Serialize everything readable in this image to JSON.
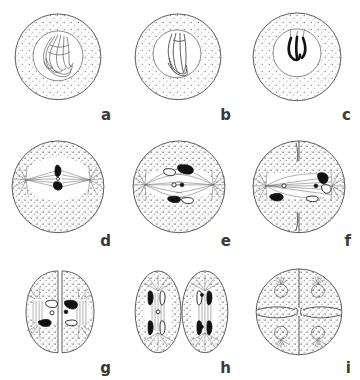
{
  "figure": {
    "style": "pen-and-ink line drawing with stippled cytoplasm",
    "background_color": "#ffffff",
    "ink_color": "#4a4a4a",
    "chromosome_color": "#111111",
    "rows": 3,
    "columns": 3,
    "panels": [
      {
        "label": "a",
        "stage_name": "Early prophase",
        "cell_shape": "circle",
        "nucleus": "present",
        "chromatin": "long thin tangled threads",
        "spindle": "none",
        "asters": 0,
        "chromosome_count": 0,
        "cell_count": 1
      },
      {
        "label": "b",
        "stage_name": "Mid prophase",
        "cell_shape": "circle",
        "nucleus": "present",
        "chromatin": "condensing into compact loop mass",
        "spindle": "none",
        "asters": 0,
        "chromosome_count": 0,
        "cell_count": 1
      },
      {
        "label": "c",
        "stage_name": "Late prophase",
        "cell_shape": "circle",
        "nucleus": "present, clear",
        "chromatin": "thick dark hooked chromosome mass",
        "spindle": "none",
        "asters": 0,
        "chromosome_count": 0,
        "cell_count": 1
      },
      {
        "label": "d",
        "stage_name": "Prometaphase",
        "cell_shape": "circle",
        "nucleus": "dissolved",
        "chromatin": "two dark chromosomes on equator",
        "spindle": "forming",
        "asters": 2,
        "chromosome_count": 2,
        "cell_count": 1
      },
      {
        "label": "e",
        "stage_name": "Metaphase",
        "cell_shape": "circle",
        "nucleus": "dissolved",
        "chromatin": "four chromosomes at metaphase plate",
        "spindle": "complete",
        "asters": 2,
        "chromosome_count": 4,
        "cell_count": 1
      },
      {
        "label": "f",
        "stage_name": "Anaphase with cleavage furrow",
        "cell_shape": "circle with furrow",
        "nucleus": "dissolved",
        "chromatin": "chromosomes separating toward poles",
        "spindle": "elongated, horizontal fibers",
        "asters": 2,
        "chromosome_count": 4,
        "cell_count": 1
      },
      {
        "label": "g",
        "stage_name": "Telophase / two daughter cells",
        "cell_shape": "two adjoining ovals",
        "nucleus": "reforming",
        "chromatin": "chromosomes in each daughter cell",
        "spindle": "remnant",
        "asters": 2,
        "chromosome_count": 6,
        "cell_count": 2
      },
      {
        "label": "h",
        "stage_name": "Second division in two cells",
        "cell_shape": "two separate ovals",
        "nucleus": "dissolved",
        "chromatin": "chromosomes at poles of each spindle",
        "spindle": "vertical in each cell",
        "asters": 4,
        "chromosome_count": 8,
        "cell_count": 2
      },
      {
        "label": "i",
        "stage_name": "Four-cell stage",
        "cell_shape": "four quadrant cells in a circle",
        "nucleus": "one per cell",
        "chromatin": "enclosed in nuclei",
        "spindle": "none",
        "asters": 4,
        "chromosome_count": 0,
        "cell_count": 4
      }
    ]
  }
}
